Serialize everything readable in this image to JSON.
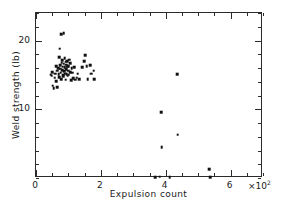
{
  "chart_data": {
    "type": "scatter",
    "title": "",
    "xlabel": "Expulsion count",
    "ylabel": "Weld strength (lb)",
    "x_multiplier": "×10",
    "x_multiplier_exp": "2",
    "xlim": [
      0,
      700
    ],
    "ylim": [
      0,
      24
    ],
    "x_ticks": [
      0,
      200,
      400,
      600
    ],
    "x_tick_labels": [
      "0",
      "2",
      "4",
      "6"
    ],
    "x_minor_step": 50,
    "y_ticks": [
      10,
      20
    ],
    "y_tick_labels": [
      "10",
      "20"
    ],
    "y_minor_step": 2,
    "grid": false,
    "legend": null,
    "marker": "square",
    "marker_color": "#111111",
    "points": [
      [
        45,
        15.0
      ],
      [
        48,
        14.9
      ],
      [
        50,
        15.4
      ],
      [
        52,
        13.4
      ],
      [
        55,
        13.1
      ],
      [
        58,
        14.6
      ],
      [
        60,
        15.2
      ],
      [
        62,
        16.3
      ],
      [
        63,
        14.1
      ],
      [
        65,
        13.2
      ],
      [
        66,
        15.6
      ],
      [
        68,
        16.0
      ],
      [
        70,
        15.1
      ],
      [
        71,
        14.7
      ],
      [
        72,
        17.6
      ],
      [
        73,
        18.8
      ],
      [
        74,
        15.9
      ],
      [
        75,
        16.4
      ],
      [
        76,
        15.3
      ],
      [
        77,
        14.4
      ],
      [
        78,
        20.9
      ],
      [
        79,
        16.8
      ],
      [
        80,
        15.7
      ],
      [
        81,
        17.1
      ],
      [
        82,
        16.2
      ],
      [
        83,
        15.0
      ],
      [
        84,
        14.8
      ],
      [
        85,
        21.1
      ],
      [
        86,
        16.6
      ],
      [
        87,
        15.5
      ],
      [
        88,
        17.4
      ],
      [
        89,
        16.1
      ],
      [
        90,
        15.2
      ],
      [
        91,
        14.3
      ],
      [
        92,
        16.9
      ],
      [
        93,
        15.8
      ],
      [
        94,
        16.5
      ],
      [
        95,
        15.1
      ],
      [
        96,
        17.0
      ],
      [
        97,
        16.2
      ],
      [
        98,
        14.9
      ],
      [
        99,
        15.6
      ],
      [
        100,
        16.3
      ],
      [
        101,
        15.0
      ],
      [
        103,
        17.2
      ],
      [
        105,
        16.7
      ],
      [
        106,
        15.4
      ],
      [
        108,
        14.2
      ],
      [
        110,
        16.0
      ],
      [
        112,
        15.3
      ],
      [
        115,
        14.5
      ],
      [
        118,
        16.1
      ],
      [
        120,
        14.3
      ],
      [
        125,
        14.6
      ],
      [
        128,
        15.2
      ],
      [
        133,
        14.4
      ],
      [
        142,
        16.1
      ],
      [
        148,
        17.0
      ],
      [
        152,
        17.9
      ],
      [
        156,
        16.3
      ],
      [
        160,
        14.4
      ],
      [
        168,
        16.4
      ],
      [
        170,
        15.2
      ],
      [
        178,
        15.6
      ],
      [
        180,
        14.4
      ],
      [
        386,
        9.6
      ],
      [
        388,
        4.5
      ],
      [
        435,
        15.1
      ],
      [
        437,
        6.3
      ],
      [
        368,
        0.1
      ],
      [
        381,
        0.2
      ],
      [
        412,
        0.1
      ],
      [
        535,
        1.3
      ],
      [
        537,
        0.1
      ]
    ]
  }
}
